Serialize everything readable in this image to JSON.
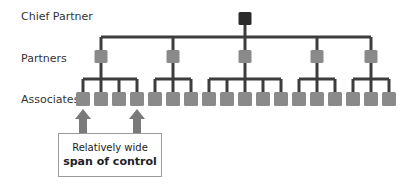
{
  "diagram": {
    "levels": [
      {
        "key": "chief",
        "label": "Chief Partner"
      },
      {
        "key": "partners",
        "label": "Partners"
      },
      {
        "key": "associates",
        "label": "Associates"
      }
    ],
    "callout": {
      "line1": "Relatively wide",
      "line2": "span of control"
    },
    "structure": {
      "chief_partner": 1,
      "partners": [
        {
          "id": "P1",
          "associates": 4
        },
        {
          "id": "P2",
          "associates": 3
        },
        {
          "id": "P3",
          "associates": 5
        },
        {
          "id": "P4",
          "associates": 3
        },
        {
          "id": "P5",
          "associates": 3
        }
      ],
      "total_associates": 18
    },
    "colors": {
      "chief_box": "#2b2b2b",
      "node_box": "#8a8a8a",
      "connector": "#3d3d3d",
      "arrow": "#7a7a7a"
    }
  }
}
